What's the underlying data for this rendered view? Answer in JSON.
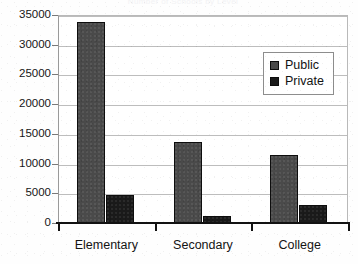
{
  "title_remnant": "Number of Schools by Level",
  "chart_data": {
    "type": "bar",
    "title": "",
    "xlabel": "",
    "ylabel": "",
    "categories": [
      "Elementary",
      "Secondary",
      "College"
    ],
    "series": [
      {
        "name": "Public",
        "color": "#4a4a4a",
        "values": [
          33800,
          13600,
          11450
        ]
      },
      {
        "name": "Private",
        "color": "#1a1a1a",
        "values": [
          4700,
          1200,
          3050
        ]
      }
    ],
    "ylim": [
      0,
      35000
    ],
    "ytick_values": [
      0,
      5000,
      10000,
      15000,
      20000,
      25000,
      30000,
      35000
    ],
    "ytick_labels": [
      "0",
      "5000",
      "10000",
      "15000",
      "20000",
      "25000",
      "30000",
      "35000"
    ],
    "grid": true,
    "grid_axis": "y",
    "legend_position": "upper right",
    "legend_entries": [
      "Public",
      "Private"
    ]
  }
}
